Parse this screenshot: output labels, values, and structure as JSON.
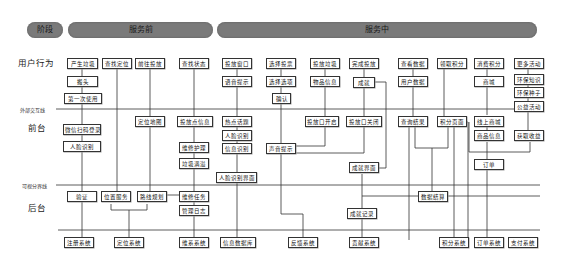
{
  "phases": {
    "stage_label": "阶段",
    "before_service": "服务前",
    "during_service": "服务中"
  },
  "rows": {
    "user_behavior": "用户行为",
    "external_interaction_line": "外部交互线",
    "front_stage": "前台",
    "visibility_line": "可视分界线",
    "back_stage": "后台"
  },
  "user_actions": {
    "a1": "产生垃圾",
    "a2": "搬头",
    "a3": "第一次使用",
    "b1": "查找定位",
    "c1": "前往投放",
    "d1": "查找状态",
    "e1": "投放窗口",
    "e2": "语音提示",
    "f1": "选择投票",
    "f2": "选择选项",
    "f3": "确认",
    "g1": "投放垃圾",
    "g2": "物品信息",
    "h1": "完成投放",
    "h2": "成就",
    "i1": "查看数据",
    "i2": "用户数据",
    "j1": "领取积分",
    "k1": "消费积分",
    "k2": "商城",
    "l1": "更多活动",
    "l2": "环保知识",
    "l3": "环保种子",
    "l4": "公益活动"
  },
  "front_stage": {
    "a1": "微信扫码登录",
    "a2": "人脸识别",
    "c1": "定位地图",
    "d1": "投放点信息",
    "d2": "维修护理",
    "d3": "垃圾满溢",
    "e1": "热点话题",
    "e2": "人脸识别",
    "e3": "信息识别",
    "e4": "人脸识别界面",
    "f1": "声音提示",
    "g1": "投放口开启",
    "h1": "投放口关闭",
    "h2": "成就界面",
    "i1": "查询结果",
    "j1": "积分页面",
    "k1": "线上商城",
    "k2": "商品信息",
    "k3": "订单",
    "l1": "获取收益"
  },
  "back_stage": {
    "a1": "验证",
    "b1": "位置服务",
    "c1": "路线规划",
    "d1": "维修任务",
    "d2": "管理日志",
    "h1": "成就记录",
    "i1": "数据结算"
  },
  "systems": {
    "s1": "注册系统",
    "s2": "定位系统",
    "s3": "维系系统",
    "s4": "信息数据库",
    "s5": "反馈系统",
    "s6": "贡献系统",
    "s7": "积分系统",
    "s8": "订单系统",
    "s9": "支付系统"
  },
  "colors": {
    "phase_fill": "#7a7a7a",
    "line": "#333333",
    "box_border": "#333333"
  }
}
